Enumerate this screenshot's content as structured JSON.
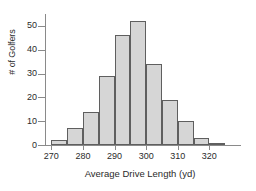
{
  "chart_data": {
    "type": "bar",
    "title": "",
    "subtitle": "",
    "xlabel": "Average Drive Length (yd)",
    "ylabel": "# of Golfers",
    "grid": false,
    "legend": null,
    "bin_width": 5,
    "xlim": [
      268,
      330
    ],
    "ylim": [
      0,
      55
    ],
    "x_ticks": [
      270,
      280,
      290,
      300,
      310,
      320
    ],
    "y_ticks": [
      0,
      10,
      20,
      30,
      40,
      50
    ],
    "categories": [
      "270-275",
      "275-280",
      "280-285",
      "285-290",
      "290-295",
      "295-300",
      "300-305",
      "305-310",
      "310-315",
      "315-320",
      "320-325",
      "325-330"
    ],
    "bin_edges": [
      270,
      275,
      280,
      285,
      290,
      295,
      300,
      305,
      310,
      315,
      320,
      325,
      330
    ],
    "values": [
      2,
      7,
      14,
      29,
      46,
      52,
      34,
      19,
      10,
      3,
      1,
      0
    ],
    "series": [
      {
        "name": "# of Golfers",
        "values": [
          2,
          7,
          14,
          29,
          46,
          52,
          34,
          19,
          10,
          3,
          1,
          0
        ]
      }
    ],
    "colors": {
      "bar_fill": "#d6d6d6",
      "bar_stroke": "#5f5f5f",
      "axis": "#8a8a8a",
      "text": "#2b2b2b",
      "background": "#ffffff"
    }
  },
  "axes": {
    "y": {
      "label": "# of Golfers",
      "ticks": [
        "0",
        "10",
        "20",
        "30",
        "40",
        "50"
      ]
    },
    "x": {
      "label": "Average Drive Length (yd)",
      "ticks": [
        "270",
        "280",
        "290",
        "300",
        "310",
        "320"
      ]
    }
  }
}
